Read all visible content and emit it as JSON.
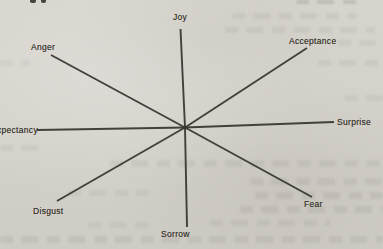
{
  "figure": {
    "type": "radial-star-diagram",
    "paper_color": "#d5d2cb",
    "line_color": "#37352f",
    "center": {
      "x": 185,
      "y": 127.5
    },
    "axes": [
      {
        "id": "joy",
        "label": "Joy",
        "x2": 180.5,
        "y2": 29
      },
      {
        "id": "acceptance",
        "label": "Acceptance",
        "x2": 307,
        "y2": 48
      },
      {
        "id": "surprise",
        "label": "Surprise",
        "x2": 334,
        "y2": 122
      },
      {
        "id": "fear",
        "label": "Fear",
        "x2": 312,
        "y2": 197
      },
      {
        "id": "sorrow",
        "label": "Sorrow",
        "x2": 187,
        "y2": 227
      },
      {
        "id": "disgust",
        "label": "Disgust",
        "x2": 57,
        "y2": 201
      },
      {
        "id": "expectancy",
        "label": "Expectancy",
        "x2": 37,
        "y2": 130
      },
      {
        "id": "anger",
        "label": "Anger",
        "x2": 51,
        "y2": 55
      }
    ],
    "opposite_pairs": [
      [
        "Joy",
        "Sorrow"
      ],
      [
        "Acceptance",
        "Disgust"
      ],
      [
        "Surprise",
        "Expectancy"
      ],
      [
        "Fear",
        "Anger"
      ]
    ]
  }
}
